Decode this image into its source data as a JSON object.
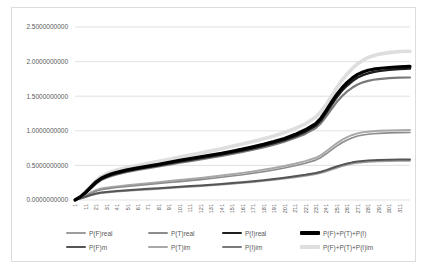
{
  "chart_data": {
    "type": "line",
    "title": "",
    "grid": true,
    "legend_position": "bottom",
    "ylim": [
      0,
      2.5
    ],
    "colors": {
      "grid": "#d9d9d9",
      "axis_text": "#595959",
      "frame_border": "#dcdcdc",
      "background": "#ffffff"
    },
    "y_tick_labels": [
      "0.0000000000",
      "0.5000000000",
      "1.0000000000",
      "1.5000000000",
      "2.0000000000",
      "2.5000000000"
    ],
    "x_tick_labels": [
      "1",
      "11",
      "21",
      "31",
      "41",
      "51",
      "61",
      "71",
      "81",
      "91",
      "101",
      "111",
      "121",
      "131",
      "141",
      "151",
      "161",
      "171",
      "181",
      "191",
      "201",
      "211",
      "221",
      "231",
      "241",
      "251",
      "261",
      "271",
      "281",
      "291",
      "301",
      "311"
    ],
    "x": [
      1,
      6,
      11,
      16,
      21,
      26,
      31,
      36,
      41,
      51,
      61,
      71,
      81,
      91,
      101,
      111,
      121,
      131,
      141,
      151,
      161,
      171,
      181,
      191,
      201,
      211,
      221,
      231,
      236,
      241,
      246,
      251,
      256,
      261,
      266,
      271,
      276,
      281,
      286,
      291,
      301,
      311,
      321
    ],
    "series": [
      {
        "name": "P(F)real",
        "color": "#9d9d9d",
        "width_px": 1.6,
        "values": [
          0,
          0.017,
          0.04,
          0.064,
          0.084,
          0.097,
          0.106,
          0.113,
          0.119,
          0.13,
          0.14,
          0.15,
          0.16,
          0.17,
          0.18,
          0.19,
          0.2,
          0.21,
          0.221,
          0.233,
          0.246,
          0.259,
          0.274,
          0.29,
          0.308,
          0.327,
          0.348,
          0.373,
          0.39,
          0.413,
          0.438,
          0.463,
          0.487,
          0.507,
          0.523,
          0.535,
          0.544,
          0.55,
          0.554,
          0.557,
          0.562,
          0.565,
          0.565
        ]
      },
      {
        "name": "P(T)real",
        "color": "#8c8c8c",
        "width_px": 1.6,
        "values": [
          0,
          0.026,
          0.06,
          0.095,
          0.127,
          0.148,
          0.161,
          0.171,
          0.18,
          0.195,
          0.21,
          0.224,
          0.238,
          0.252,
          0.266,
          0.28,
          0.295,
          0.311,
          0.328,
          0.346,
          0.365,
          0.386,
          0.409,
          0.434,
          0.462,
          0.494,
          0.53,
          0.576,
          0.615,
          0.668,
          0.724,
          0.778,
          0.827,
          0.867,
          0.9,
          0.924,
          0.94,
          0.951,
          0.958,
          0.963,
          0.97,
          0.974,
          0.975
        ]
      },
      {
        "name": "P(I)real",
        "color": "#1f1f1f",
        "width_px": 2.4,
        "values": [
          0,
          0.04,
          0.1,
          0.17,
          0.245,
          0.3,
          0.335,
          0.362,
          0.385,
          0.42,
          0.45,
          0.475,
          0.5,
          0.53,
          0.555,
          0.58,
          0.605,
          0.63,
          0.655,
          0.685,
          0.715,
          0.748,
          0.782,
          0.822,
          0.865,
          0.92,
          0.985,
          1.075,
          1.15,
          1.26,
          1.375,
          1.485,
          1.58,
          1.655,
          1.72,
          1.77,
          1.805,
          1.83,
          1.85,
          1.862,
          1.88,
          1.893,
          1.9
        ]
      },
      {
        "name": "P(F)+P(T)+P(I)",
        "color": "#000000",
        "width_px": 3.2,
        "values": [
          0,
          0.045,
          0.11,
          0.185,
          0.26,
          0.315,
          0.35,
          0.378,
          0.4,
          0.435,
          0.465,
          0.49,
          0.515,
          0.545,
          0.575,
          0.6,
          0.625,
          0.65,
          0.675,
          0.705,
          0.735,
          0.77,
          0.805,
          0.845,
          0.89,
          0.945,
          1.015,
          1.105,
          1.185,
          1.295,
          1.415,
          1.525,
          1.62,
          1.7,
          1.765,
          1.815,
          1.85,
          1.875,
          1.89,
          1.9,
          1.915,
          1.925,
          1.93
        ]
      },
      {
        "name": "P(F)m",
        "color": "#555555",
        "width_px": 2,
        "values": [
          0,
          0.02,
          0.046,
          0.072,
          0.094,
          0.108,
          0.117,
          0.124,
          0.13,
          0.141,
          0.151,
          0.161,
          0.171,
          0.181,
          0.191,
          0.201,
          0.211,
          0.222,
          0.233,
          0.245,
          0.258,
          0.272,
          0.287,
          0.304,
          0.322,
          0.342,
          0.364,
          0.39,
          0.408,
          0.432,
          0.458,
          0.484,
          0.508,
          0.528,
          0.544,
          0.556,
          0.564,
          0.57,
          0.574,
          0.577,
          0.581,
          0.584,
          0.585
        ]
      },
      {
        "name": "P(T)im",
        "color": "#a8a8a8",
        "width_px": 2,
        "values": [
          0,
          0.03,
          0.068,
          0.108,
          0.142,
          0.165,
          0.178,
          0.188,
          0.197,
          0.213,
          0.228,
          0.243,
          0.258,
          0.273,
          0.288,
          0.303,
          0.318,
          0.335,
          0.353,
          0.372,
          0.392,
          0.413,
          0.437,
          0.463,
          0.492,
          0.525,
          0.562,
          0.61,
          0.65,
          0.705,
          0.762,
          0.818,
          0.868,
          0.908,
          0.94,
          0.963,
          0.978,
          0.988,
          0.995,
          1.0,
          1.006,
          1.009,
          1.01
        ]
      },
      {
        "name": "P(I)im",
        "color": "#7a7a7a",
        "width_px": 2.2,
        "values": [
          0,
          0.038,
          0.095,
          0.162,
          0.235,
          0.288,
          0.322,
          0.348,
          0.37,
          0.405,
          0.435,
          0.46,
          0.485,
          0.512,
          0.538,
          0.562,
          0.587,
          0.612,
          0.637,
          0.665,
          0.695,
          0.727,
          0.76,
          0.8,
          0.842,
          0.895,
          0.955,
          1.04,
          1.11,
          1.21,
          1.315,
          1.415,
          1.5,
          1.57,
          1.625,
          1.668,
          1.7,
          1.722,
          1.738,
          1.748,
          1.762,
          1.768,
          1.77
        ]
      },
      {
        "name": "P(F)+P(T)+P(I)im",
        "color": "#dedede",
        "width_px": 3.6,
        "values": [
          0,
          0.05,
          0.12,
          0.2,
          0.28,
          0.34,
          0.38,
          0.41,
          0.435,
          0.47,
          0.5,
          0.53,
          0.56,
          0.59,
          0.62,
          0.65,
          0.68,
          0.71,
          0.74,
          0.775,
          0.81,
          0.845,
          0.885,
          0.925,
          0.975,
          1.03,
          1.1,
          1.2,
          1.28,
          1.38,
          1.5,
          1.62,
          1.73,
          1.82,
          1.9,
          1.97,
          2.02,
          2.06,
          2.085,
          2.105,
          2.13,
          2.145,
          2.15
        ]
      }
    ],
    "legend_rows": [
      [
        0,
        1,
        2,
        3
      ],
      [
        4,
        5,
        6,
        7
      ]
    ]
  }
}
